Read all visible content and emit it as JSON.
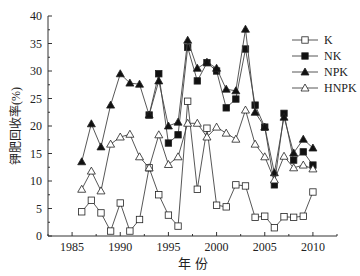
{
  "chart_data": {
    "type": "line",
    "title": "",
    "xlabel": "年 份",
    "ylabel": "钾肥回收率(%)",
    "xlim": [
      1982.5,
      2012.5
    ],
    "ylim": [
      0,
      40
    ],
    "xticks": [
      1985,
      1990,
      1995,
      2000,
      2005,
      2010
    ],
    "yticks": [
      0,
      5,
      10,
      15,
      20,
      25,
      30,
      35,
      40
    ],
    "grid": false,
    "legend_position": "upper right",
    "series": [
      {
        "name": "K",
        "marker": "square-open",
        "x": [
          1986,
          1987,
          1988,
          1989,
          1990,
          1991,
          1992,
          1993,
          1994,
          1995,
          1996,
          1997,
          1998,
          1999,
          2000,
          2001,
          2002,
          2003,
          2004,
          2005,
          2006,
          2007,
          2008,
          2009,
          2010
        ],
        "values": [
          4.4,
          6.5,
          4.2,
          0.9,
          6.0,
          0.9,
          3.0,
          12.4,
          7.5,
          3.8,
          1.8,
          24.5,
          8.5,
          19.6,
          5.6,
          5.3,
          9.3,
          9.1,
          3.4,
          3.6,
          1.5,
          3.5,
          3.4,
          3.6,
          8.0
        ]
      },
      {
        "name": "NK",
        "marker": "square-filled",
        "x": [
          1993,
          1994,
          1995,
          1996,
          1997,
          1998,
          1999,
          2000,
          2001,
          2002,
          2003,
          2004,
          2005,
          2006,
          2007,
          2008,
          2009,
          2010
        ],
        "values": [
          22.0,
          29.5,
          16.9,
          18.4,
          34.3,
          28.2,
          31.5,
          30.0,
          23.3,
          24.9,
          34.0,
          23.8,
          19.8,
          9.3,
          22.3,
          13.8,
          15.3,
          12.9
        ]
      },
      {
        "name": "NPK",
        "marker": "triangle-filled",
        "x": [
          1986,
          1987,
          1988,
          1989,
          1990,
          1991,
          1992,
          1993,
          1994,
          1995,
          1996,
          1997,
          1998,
          1999,
          2000,
          2001,
          2002,
          2003,
          2004,
          2005,
          2006,
          2007,
          2008,
          2009,
          2010
        ],
        "values": [
          13.5,
          20.4,
          16.2,
          23.8,
          29.5,
          27.8,
          27.6,
          22.0,
          28.2,
          20.0,
          20.7,
          35.6,
          30.5,
          31.6,
          30.5,
          26.7,
          26.4,
          37.6,
          22.5,
          19.8,
          11.5,
          21.6,
          15.1,
          17.6,
          16.0
        ]
      },
      {
        "name": "HNPK",
        "marker": "triangle-open",
        "x": [
          1986,
          1987,
          1988,
          1989,
          1990,
          1991,
          1992,
          1993,
          1994,
          1995,
          1996,
          1997,
          1998,
          1999,
          2000,
          2001,
          2002,
          2003,
          2004,
          2005,
          2006,
          2007,
          2008,
          2009,
          2010
        ],
        "values": [
          8.5,
          11.8,
          8.2,
          16.7,
          18.0,
          18.5,
          14.4,
          12.4,
          18.4,
          13.0,
          14.4,
          20.5,
          20.5,
          18.0,
          19.8,
          18.7,
          17.6,
          22.9,
          16.7,
          14.4,
          10.2,
          14.5,
          12.4,
          12.9,
          12.2
        ]
      }
    ]
  }
}
